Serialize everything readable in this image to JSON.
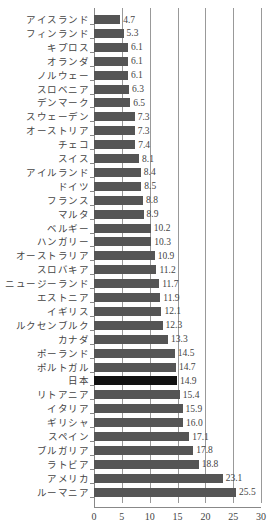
{
  "chart_data": {
    "type": "bar",
    "orientation": "horizontal",
    "title": "",
    "xlabel": "",
    "ylabel": "",
    "xlim": [
      0,
      30
    ],
    "xticks": [
      0,
      5,
      10,
      15,
      20,
      25,
      30
    ],
    "grid": "vertical",
    "highlight": "日本",
    "bar_color": "#555555",
    "highlight_color": "#111111",
    "categories": [
      "アイスランド",
      "フィンランド",
      "キプロス",
      "オランダ",
      "ノルウェー",
      "スロベニア",
      "デンマーク",
      "スウェーデン",
      "オーストリア",
      "チェコ",
      "スイス",
      "アイルランド",
      "ドイツ",
      "フランス",
      "マルタ",
      "ベルギー",
      "ハンガリー",
      "オーストラリア",
      "スロバキア",
      "ニュージーランド",
      "エストニア",
      "イギリス",
      "ルクセンブルク",
      "カナダ",
      "ポーランド",
      "ポルトガル",
      "日本",
      "リトアニア",
      "イタリア",
      "ギリシャ",
      "スペイン",
      "ブルガリア",
      "ラトビア",
      "アメリカ",
      "ルーマニア"
    ],
    "values": [
      4.7,
      5.3,
      6.1,
      6.1,
      6.1,
      6.3,
      6.5,
      7.3,
      7.3,
      7.4,
      8.1,
      8.4,
      8.5,
      8.8,
      8.9,
      10.2,
      10.3,
      10.9,
      11.2,
      11.7,
      11.9,
      12.1,
      12.3,
      13.3,
      14.5,
      14.7,
      14.9,
      15.4,
      15.9,
      16.0,
      17.1,
      17.8,
      18.8,
      23.1,
      25.5
    ],
    "value_labels": [
      "4.7",
      "5.3",
      "6.1",
      "6.1",
      "6.1",
      "6.3",
      "6.5",
      "7.3",
      "7.3",
      "7.4",
      "8.1",
      "8.4",
      "8.5",
      "8.8",
      "8.9",
      "10.2",
      "10.3",
      "10.9",
      "11.2",
      "11.7",
      "11.9",
      "12.1",
      "12.3",
      "13.3",
      "14.5",
      "14.7",
      "14.9",
      "15.4",
      "15.9",
      "16.0",
      "17.1",
      "17.8",
      "18.8",
      "23.1",
      "25.5"
    ]
  }
}
